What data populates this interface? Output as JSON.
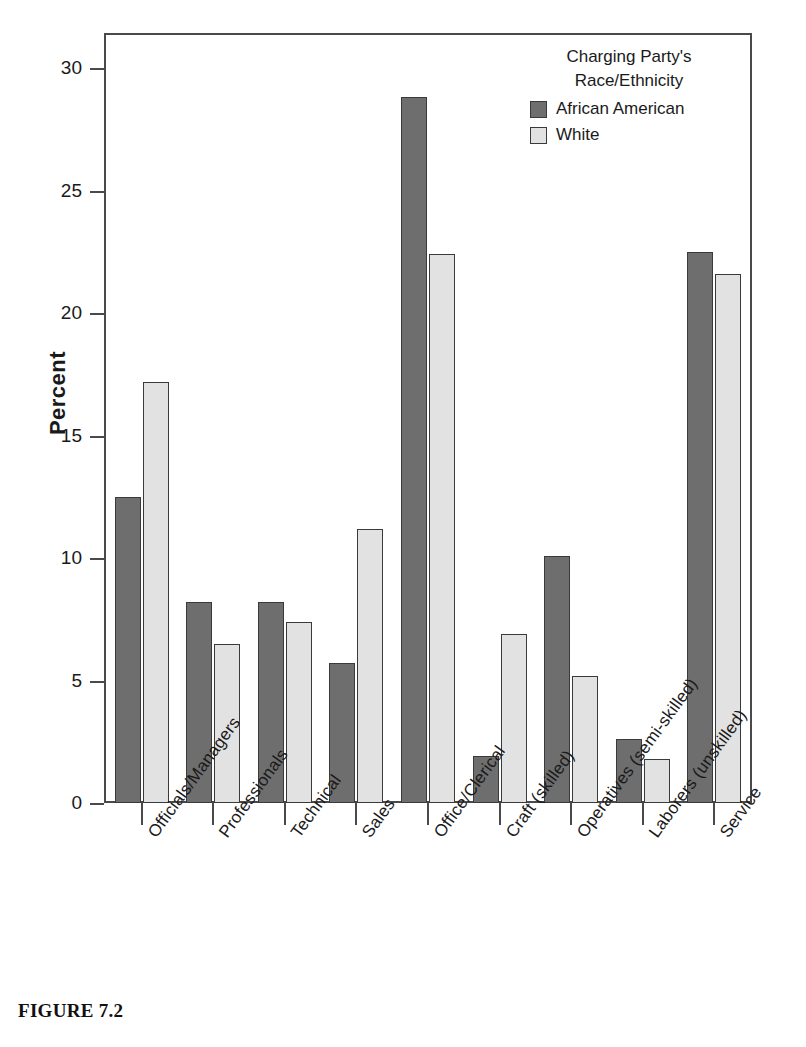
{
  "caption": "FIGURE 7.2",
  "legend": {
    "title_lines": [
      "Charging Party's",
      "Race/Ethnicity"
    ],
    "entries": [
      {
        "label": "African American",
        "color": "#6e6e6e"
      },
      {
        "label": "White",
        "color": "#e2e2e2"
      }
    ]
  },
  "chart_data": {
    "type": "bar",
    "title": "",
    "xlabel": "",
    "ylabel": "Percent",
    "ylim": [
      0,
      32
    ],
    "yticks": [
      0,
      5,
      10,
      15,
      20,
      25,
      30
    ],
    "ytick_labels": [
      "0",
      "5",
      "10",
      "15",
      "20",
      "25",
      "30"
    ],
    "grid": false,
    "legend_position": "top-right",
    "legend_title": "Charging Party's Race/Ethnicity",
    "categories": [
      "Officials/Managers",
      "Professionals",
      "Technical",
      "Sales",
      "Office/Clerical",
      "Craft (skilled)",
      "Operatives (semi-skilled)",
      "Laborers (unskilled)",
      "Service"
    ],
    "series": [
      {
        "name": "African American",
        "color": "#6e6e6e",
        "values": [
          12.5,
          8.2,
          8.2,
          5.7,
          28.8,
          1.9,
          10.1,
          2.6,
          22.5
        ]
      },
      {
        "name": "White",
        "color": "#e2e2e2",
        "values": [
          17.2,
          6.5,
          7.4,
          11.2,
          22.4,
          6.9,
          5.2,
          1.8,
          21.6
        ]
      }
    ]
  }
}
